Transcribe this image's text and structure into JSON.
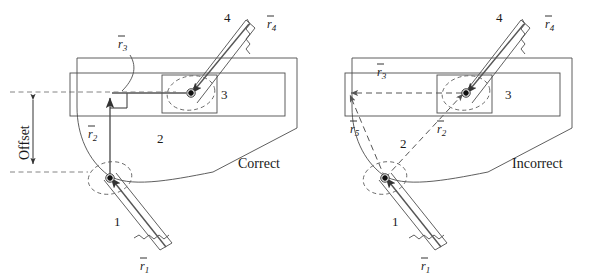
{
  "figure": {
    "width": 601,
    "height": 279,
    "background": "#ffffff",
    "line_color": "#4d4d4d",
    "dash_color": "#666666",
    "text_color": "#1a1a1a"
  },
  "panels": [
    {
      "id": "correct",
      "caption": "Correct",
      "caption_x": 238,
      "caption_y": 168,
      "offset_label": "Offset",
      "link_numbers": [
        {
          "text": "1",
          "x": 114,
          "y": 226
        },
        {
          "text": "2",
          "x": 157,
          "y": 143
        },
        {
          "text": "3",
          "x": 221,
          "y": 99
        },
        {
          "text": "4",
          "x": 224,
          "y": 22
        }
      ],
      "vectors": [
        {
          "name": "r1",
          "base": "r",
          "sub": "1",
          "x": 143,
          "y": 268,
          "style": "solid"
        },
        {
          "name": "r2",
          "base": "r",
          "sub": "2",
          "x": 91,
          "y": 136,
          "style": "solid"
        },
        {
          "name": "r3",
          "base": "r",
          "sub": "3",
          "x": 121,
          "y": 46,
          "style": "solid"
        },
        {
          "name": "r4",
          "base": "r",
          "sub": "4",
          "x": 270,
          "y": 27,
          "style": "solid"
        }
      ]
    },
    {
      "id": "incorrect",
      "caption": "Incorrect",
      "caption_x": 512,
      "caption_y": 168,
      "offset_label": null,
      "link_numbers": [
        {
          "text": "1",
          "x": 392,
          "y": 226
        },
        {
          "text": "2",
          "x": 400,
          "y": 148
        },
        {
          "text": "3",
          "x": 505,
          "y": 99
        },
        {
          "text": "4",
          "x": 496,
          "y": 22
        }
      ],
      "vectors": [
        {
          "name": "r1",
          "base": "r",
          "sub": "1",
          "x": 424,
          "y": 268,
          "style": "solid"
        },
        {
          "name": "r2",
          "base": "r",
          "sub": "2",
          "x": 440,
          "y": 131,
          "style": "dashed"
        },
        {
          "name": "r3",
          "base": "r",
          "sub": "3",
          "x": 380,
          "y": 74,
          "style": "dashed"
        },
        {
          "name": "r4",
          "base": "r",
          "sub": "4",
          "x": 548,
          "y": 27,
          "style": "solid"
        },
        {
          "name": "r5",
          "base": "r",
          "sub": "5",
          "x": 353,
          "y": 131,
          "style": "dashed"
        }
      ]
    }
  ],
  "glyphs": {
    "vector_overbar": "¯",
    "ground_hatch": "zigzag-break"
  }
}
